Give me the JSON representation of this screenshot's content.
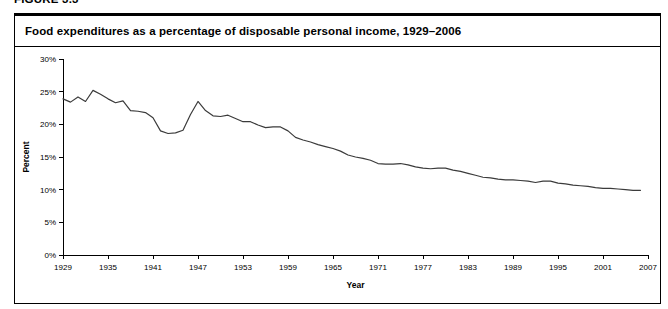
{
  "figure": {
    "caption": "FIGURE 3.3",
    "panel_title": "Food expenditures as a percentage of disposable personal income, 1929–2006"
  },
  "chart_data": {
    "type": "line",
    "title": "Food expenditures as a percentage of disposable personal income, 1929–2006",
    "xlabel": "Year",
    "ylabel": "Percent",
    "xlim": [
      1929,
      2007
    ],
    "ylim": [
      0,
      30
    ],
    "grid": false,
    "legend": null,
    "y_tick_labels": [
      "0%",
      "5%",
      "10%",
      "15%",
      "20%",
      "25%",
      "30%"
    ],
    "y_ticks": [
      0,
      5,
      10,
      15,
      20,
      25,
      30
    ],
    "x_ticks": [
      1929,
      1935,
      1941,
      1947,
      1953,
      1959,
      1965,
      1971,
      1977,
      1983,
      1989,
      1995,
      2001,
      2007
    ],
    "x_tick_labels": [
      "1929",
      "1935",
      "1941",
      "1947",
      "1953",
      "1959",
      "1965",
      "1971",
      "1977",
      "1983",
      "1989",
      "1995",
      "2001",
      "2007"
    ],
    "series": [
      {
        "name": "Food expenditures as a percentage of disposable personal income",
        "color": "#3b3b3b",
        "x": [
          1929,
          1930,
          1931,
          1932,
          1933,
          1934,
          1935,
          1936,
          1937,
          1938,
          1939,
          1940,
          1941,
          1942,
          1943,
          1944,
          1945,
          1946,
          1947,
          1948,
          1949,
          1950,
          1951,
          1952,
          1953,
          1954,
          1955,
          1956,
          1957,
          1958,
          1959,
          1960,
          1961,
          1962,
          1963,
          1964,
          1965,
          1966,
          1967,
          1968,
          1969,
          1970,
          1971,
          1972,
          1973,
          1974,
          1975,
          1976,
          1977,
          1978,
          1979,
          1980,
          1981,
          1982,
          1983,
          1984,
          1985,
          1986,
          1987,
          1988,
          1989,
          1990,
          1991,
          1992,
          1993,
          1994,
          1995,
          1996,
          1997,
          1998,
          1999,
          2000,
          2001,
          2002,
          2003,
          2004,
          2005,
          2006
        ],
        "values": [
          23.9,
          23.4,
          24.2,
          23.5,
          25.2,
          24.6,
          23.9,
          23.3,
          23.6,
          22.1,
          22.0,
          21.8,
          21.0,
          19.0,
          18.6,
          18.7,
          19.1,
          21.5,
          23.5,
          22.1,
          21.3,
          21.2,
          21.4,
          20.9,
          20.4,
          20.4,
          19.9,
          19.5,
          19.6,
          19.6,
          19.0,
          18.0,
          17.6,
          17.3,
          16.9,
          16.6,
          16.3,
          15.9,
          15.3,
          15.0,
          14.8,
          14.5,
          14.0,
          13.9,
          13.9,
          14.0,
          13.8,
          13.5,
          13.3,
          13.2,
          13.3,
          13.3,
          13.0,
          12.8,
          12.5,
          12.2,
          11.9,
          11.8,
          11.6,
          11.5,
          11.5,
          11.4,
          11.3,
          11.1,
          11.3,
          11.3,
          11.0,
          10.9,
          10.7,
          10.6,
          10.5,
          10.3,
          10.2,
          10.2,
          10.1,
          10.0,
          9.9,
          9.9
        ]
      }
    ]
  },
  "axis": {
    "x_title": "Year",
    "y_title": "Percent"
  }
}
